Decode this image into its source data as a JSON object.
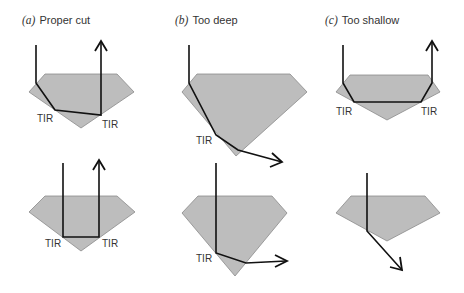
{
  "figure": {
    "panels": [
      {
        "letter": "(a)",
        "title": "Proper cut"
      },
      {
        "letter": "(b)",
        "title": "Too deep"
      },
      {
        "letter": "(c)",
        "title": "Too shallow"
      }
    ],
    "tir_label": "TIR",
    "colors": {
      "gem_fill": "#bdbdbd",
      "gem_edge": "#8a8a8a",
      "ray": "#111111",
      "text": "#333333"
    }
  }
}
